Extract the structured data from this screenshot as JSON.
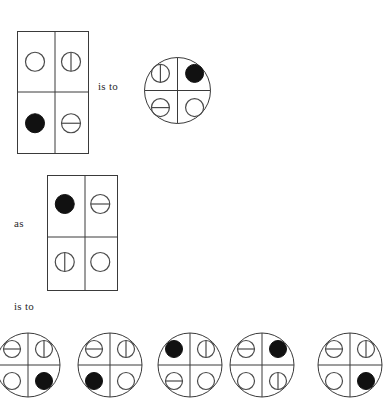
{
  "puzzle": {
    "type": "visual-analogy",
    "glyph_legend": {
      "empty": "empty-circle",
      "vertical": "circle-with-vertical-line",
      "horizontal": "circle-with-horizontal-line",
      "filled": "filled-black-circle"
    },
    "connector_labels": {
      "is_to_1": "is to",
      "as": "as",
      "is_to_2": "is to"
    },
    "colors": {
      "stroke": "#3a3a3a",
      "glyph_stroke": "#4a4a4a",
      "fill_solid": "#111111",
      "background": "#ffffff",
      "text": "#2b2b2b"
    },
    "stimulus_a": {
      "shape": "rectangle",
      "grid": "2x2",
      "cells": [
        {
          "position": "top-left",
          "glyph": "empty"
        },
        {
          "position": "top-right",
          "glyph": "vertical"
        },
        {
          "position": "bottom-left",
          "glyph": "filled"
        },
        {
          "position": "bottom-right",
          "glyph": "horizontal"
        }
      ]
    },
    "stimulus_b": {
      "shape": "circle",
      "grid": "2x2",
      "cells": [
        {
          "position": "top-left",
          "glyph": "vertical"
        },
        {
          "position": "top-right",
          "glyph": "filled"
        },
        {
          "position": "bottom-left",
          "glyph": "horizontal"
        },
        {
          "position": "bottom-right",
          "glyph": "empty"
        }
      ]
    },
    "stimulus_c": {
      "shape": "rectangle",
      "grid": "2x2",
      "cells": [
        {
          "position": "top-left",
          "glyph": "filled"
        },
        {
          "position": "top-right",
          "glyph": "horizontal"
        },
        {
          "position": "bottom-left",
          "glyph": "vertical"
        },
        {
          "position": "bottom-right",
          "glyph": "empty"
        }
      ]
    },
    "options": [
      {
        "id": "A",
        "shape": "circle",
        "cells": [
          {
            "position": "top-left",
            "glyph": "horizontal"
          },
          {
            "position": "top-right",
            "glyph": "vertical"
          },
          {
            "position": "bottom-left",
            "glyph": "empty"
          },
          {
            "position": "bottom-right",
            "glyph": "filled"
          }
        ]
      },
      {
        "id": "B",
        "shape": "circle",
        "cells": [
          {
            "position": "top-left",
            "glyph": "horizontal"
          },
          {
            "position": "top-right",
            "glyph": "vertical"
          },
          {
            "position": "bottom-left",
            "glyph": "filled"
          },
          {
            "position": "bottom-right",
            "glyph": "empty"
          }
        ]
      },
      {
        "id": "C",
        "shape": "circle",
        "cells": [
          {
            "position": "top-left",
            "glyph": "filled"
          },
          {
            "position": "top-right",
            "glyph": "vertical"
          },
          {
            "position": "bottom-left",
            "glyph": "horizontal"
          },
          {
            "position": "bottom-right",
            "glyph": "empty"
          }
        ]
      },
      {
        "id": "D",
        "shape": "circle",
        "cells": [
          {
            "position": "top-left",
            "glyph": "horizontal"
          },
          {
            "position": "top-right",
            "glyph": "filled"
          },
          {
            "position": "bottom-left",
            "glyph": "empty"
          },
          {
            "position": "bottom-right",
            "glyph": "vertical"
          }
        ]
      },
      {
        "id": "E",
        "shape": "circle",
        "cells": [
          {
            "position": "top-left",
            "glyph": "horizontal"
          },
          {
            "position": "top-right",
            "glyph": "vertical"
          },
          {
            "position": "bottom-left",
            "glyph": "empty"
          },
          {
            "position": "bottom-right",
            "glyph": "filled"
          }
        ]
      }
    ],
    "layout": {
      "rect_a": {
        "x": 17,
        "y": 31,
        "w": 71,
        "h": 122
      },
      "circle_b": {
        "cx": 177,
        "cy": 90,
        "r": 33
      },
      "rect_c": {
        "x": 47,
        "y": 175,
        "w": 70,
        "h": 115
      },
      "option_r": 32,
      "option_cy": 365,
      "option_cx": [
        28,
        110,
        190,
        262,
        350
      ],
      "label_is_to_1": {
        "x": 98,
        "y": 80
      },
      "label_as": {
        "x": 14,
        "y": 217
      },
      "label_is_to_2": {
        "x": 14,
        "y": 300
      }
    }
  }
}
